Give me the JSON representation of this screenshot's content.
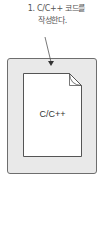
{
  "caption": {
    "line1": "1. C/C++ 코드를",
    "line2": "작성한다."
  },
  "document": {
    "label": "C/C++",
    "icon": "document-icon"
  },
  "colors": {
    "outer_fill": "#e9e9e9",
    "outer_border": "#6e6e6e",
    "page_fill": "#ffffff",
    "page_border": "#555555",
    "text": "#555555"
  }
}
